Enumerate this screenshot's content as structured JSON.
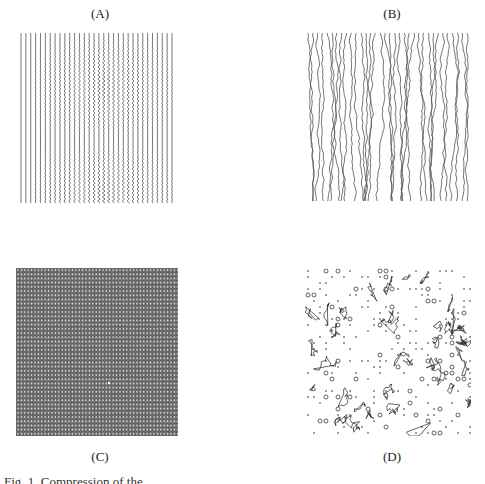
{
  "figure": {
    "panels": [
      {
        "id": "A",
        "label": "(A)",
        "pattern": "straight-to-wavy-vertical-lines",
        "line_count": 32,
        "color": "#555555"
      },
      {
        "id": "B",
        "label": "(B)",
        "pattern": "irregular-wiggly-vertical-lines",
        "line_count": 34,
        "color": "#555555"
      },
      {
        "id": "C",
        "label": "(C)",
        "pattern": "dense-circle-grid",
        "color": "#444444"
      },
      {
        "id": "D",
        "label": "(D)",
        "pattern": "sparse-contours-and-dots",
        "color": "#222222"
      }
    ],
    "caption": "Fig. 1. Compression of the ..."
  }
}
